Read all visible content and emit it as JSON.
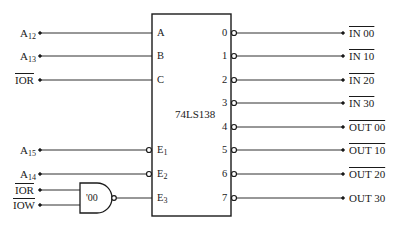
{
  "chip": {
    "name": "74LS138",
    "inputs_left": [
      {
        "signal": "A",
        "sub": "12",
        "overbar": false,
        "pin": "A",
        "active_low": false,
        "y": 33
      },
      {
        "signal": "A",
        "sub": "13",
        "overbar": false,
        "pin": "B",
        "active_low": false,
        "y": 56
      },
      {
        "signal": "IOR",
        "sub": "",
        "overbar": true,
        "pin": "C",
        "active_low": false,
        "y": 80
      },
      {
        "signal": "A",
        "sub": "15",
        "overbar": false,
        "pin": "E",
        "pin_sub": "1",
        "active_low": true,
        "y": 150
      },
      {
        "signal": "A",
        "sub": "14",
        "overbar": false,
        "pin": "E",
        "pin_sub": "2",
        "active_low": true,
        "y": 174
      }
    ],
    "enable3": {
      "pin": "E",
      "pin_sub": "3",
      "y": 198
    },
    "outputs": [
      {
        "pin": "0",
        "label": "IN 00",
        "overbar": true,
        "y": 33
      },
      {
        "pin": "1",
        "label": "IN 10",
        "overbar": true,
        "y": 56
      },
      {
        "pin": "2",
        "label": "IN 20",
        "overbar": true,
        "y": 80
      },
      {
        "pin": "3",
        "label": "IN 30",
        "overbar": true,
        "y": 103
      },
      {
        "pin": "4",
        "label": "OUT 00",
        "overbar": true,
        "y": 127
      },
      {
        "pin": "5",
        "label": "OUT 10",
        "overbar": true,
        "y": 150
      },
      {
        "pin": "6",
        "label": "OUT 20",
        "overbar": true,
        "y": 174
      },
      {
        "pin": "7",
        "label": "OUT 30",
        "overbar": false,
        "y": 198
      }
    ]
  },
  "gate": {
    "type": "NAND",
    "label": "'00",
    "inputs": [
      {
        "signal": "IOR",
        "overbar": true
      },
      {
        "signal": "IOW",
        "overbar": true
      }
    ]
  },
  "labels": {
    "a12": "A",
    "a12_sub": "12",
    "a13": "A",
    "a13_sub": "13",
    "ior_c": "IOR",
    "a15": "A",
    "a15_sub": "15",
    "a14": "A",
    "a14_sub": "14",
    "gate_ior": "IOR",
    "gate_iow": "IOW",
    "pin_a": "A",
    "pin_b": "B",
    "pin_c": "C",
    "pin_e": "E",
    "pin_e1_sub": "1",
    "pin_e2_sub": "2",
    "pin_e3_sub": "3",
    "out0": "0",
    "out1": "1",
    "out2": "2",
    "out3": "3",
    "out4": "4",
    "out5": "5",
    "out6": "6",
    "out7": "7",
    "in00": "IN 00",
    "in10": "IN 10",
    "in20": "IN 20",
    "in30": "IN 30",
    "out00": "OUT 00",
    "out10": "OUT 10",
    "out20": "OUT 20",
    "out30": "OUT 30"
  }
}
